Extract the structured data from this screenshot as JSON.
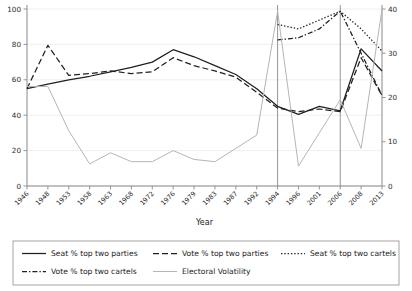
{
  "chart_data": {
    "type": "line",
    "title": "",
    "xlabel": "Year",
    "ylabel": "",
    "ylim": [
      0,
      100
    ],
    "y2lim": [
      0,
      40
    ],
    "grid": true,
    "legend_position": "bottom",
    "x": [
      1946,
      1948,
      1953,
      1958,
      1963,
      1968,
      1972,
      1976,
      1979,
      1983,
      1987,
      1992,
      1994,
      1996,
      2001,
      2006,
      2008,
      2013
    ],
    "xtick_labels": [
      "1946",
      "1948",
      "1953",
      "1958",
      "1963",
      "1968",
      "1972",
      "1976",
      "1979",
      "1983",
      "1987",
      "1992",
      "1994",
      "1996",
      "2001",
      "2006",
      "2008",
      "2013"
    ],
    "ytick_labels": [
      "0",
      "20",
      "40",
      "60",
      "80",
      "100"
    ],
    "ytick_values": [
      0,
      20,
      40,
      60,
      80,
      100
    ],
    "y2tick_labels": [
      "0",
      "10",
      "20",
      "30",
      "40"
    ],
    "y2tick_values": [
      0,
      10,
      20,
      30,
      40
    ],
    "vertical_markers": [
      1994,
      2006
    ],
    "series": [
      {
        "name": "Seat % top two parties",
        "style": "solid",
        "color": "#231f20",
        "axis": "left",
        "values": [
          55,
          57.5,
          60,
          62,
          64.5,
          67,
          70,
          77,
          73,
          68,
          63,
          55,
          45,
          40.5,
          45,
          42.5,
          77.5,
          65
        ]
      },
      {
        "name": "Vote % top two parties",
        "style": "dashed",
        "color": "#231f20",
        "axis": "left",
        "values": [
          55,
          79.5,
          62.5,
          63.5,
          65,
          63.5,
          64.5,
          72.5,
          68,
          65,
          61.5,
          53,
          44,
          42,
          43.5,
          42,
          72.5,
          51
        ]
      },
      {
        "name": "Seat % top two cartels",
        "style": "dotted",
        "color": "#231f20",
        "axis": "right",
        "values": [
          null,
          null,
          null,
          null,
          null,
          null,
          null,
          null,
          null,
          null,
          null,
          null,
          36.5,
          35.5,
          37.5,
          39.5,
          35.5,
          30.5
        ]
      },
      {
        "name": "Vote % top two cartels",
        "style": "dashdot",
        "color": "#231f20",
        "axis": "right",
        "values": [
          null,
          null,
          null,
          null,
          null,
          null,
          null,
          null,
          null,
          null,
          null,
          null,
          33,
          33.5,
          35.5,
          39.5,
          30,
          20.5
        ]
      },
      {
        "name": "Electoral Volatility",
        "style": "solid-light",
        "color": "#b5b5b5",
        "axis": "right",
        "values": [
          22.5,
          22.5,
          12.5,
          5,
          7.5,
          5.5,
          5.5,
          8,
          6,
          5.5,
          8.5,
          11.5,
          39.5,
          4.5,
          12,
          19.5,
          8.5,
          40
        ]
      }
    ]
  },
  "legend": {
    "entries": [
      {
        "label": "Seat % top two parties",
        "style": "solid"
      },
      {
        "label": "Vote % top two parties",
        "style": "dashed"
      },
      {
        "label": "Seat % top two cartels",
        "style": "dotted"
      },
      {
        "label": "Vote % top two cartels",
        "style": "dashdot"
      },
      {
        "label": "Electoral Volatility",
        "style": "solid-light"
      }
    ]
  },
  "axis_titles": {
    "x": "Year"
  }
}
